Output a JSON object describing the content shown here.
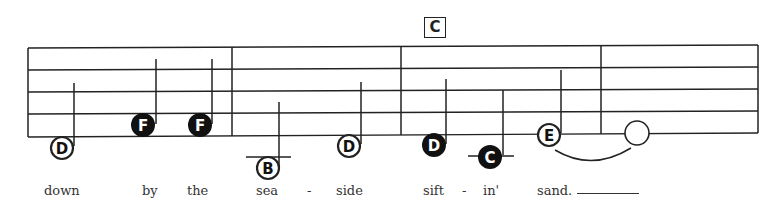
{
  "chord": {
    "label": "C"
  },
  "staff": {
    "lines": 5,
    "barlines": 4,
    "ink_color": "#222222"
  },
  "notes": [
    {
      "letter": "D",
      "filled": false,
      "duration": "half"
    },
    {
      "letter": "F",
      "filled": true,
      "duration": "quarter"
    },
    {
      "letter": "F",
      "filled": true,
      "duration": "quarter"
    },
    {
      "letter": "B",
      "filled": false,
      "duration": "half",
      "ledger": true
    },
    {
      "letter": "D",
      "filled": false,
      "duration": "half"
    },
    {
      "letter": "D",
      "filled": true,
      "duration": "quarter"
    },
    {
      "letter": "C",
      "filled": true,
      "duration": "quarter",
      "ledger": true
    },
    {
      "letter": "E",
      "filled": false,
      "duration": "half",
      "tied": true
    },
    {
      "letter": "",
      "filled": false,
      "duration": "whole"
    }
  ],
  "lyrics": [
    {
      "text": "down"
    },
    {
      "text": "by"
    },
    {
      "text": "the"
    },
    {
      "text": "sea"
    },
    {
      "text": "-"
    },
    {
      "text": "side"
    },
    {
      "text": "sift"
    },
    {
      "text": "-"
    },
    {
      "text": "in'"
    },
    {
      "text": "sand."
    }
  ]
}
